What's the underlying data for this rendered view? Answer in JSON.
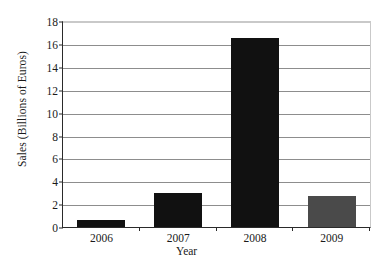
{
  "chart_data": {
    "type": "bar",
    "title": "",
    "xlabel": "Year",
    "ylabel": "Sales (Billions of Euros)",
    "categories": [
      "2006",
      "2007",
      "2008",
      "2009"
    ],
    "values": [
      0.6,
      3.0,
      16.5,
      2.7
    ],
    "bar_colors": [
      "#111111",
      "#111111",
      "#111111",
      "#4a4a4a"
    ],
    "ylim": [
      0,
      18
    ],
    "ytick_step": 2,
    "yticks": [
      "18",
      "16",
      "14",
      "12",
      "10",
      "8",
      "6",
      "4",
      "2",
      "0"
    ],
    "grid": "horizontal",
    "legend": "none",
    "axis_color": "#2a2a2a",
    "gridline_color": "#8d8d8d",
    "frame_color": "#c9c9c9"
  }
}
